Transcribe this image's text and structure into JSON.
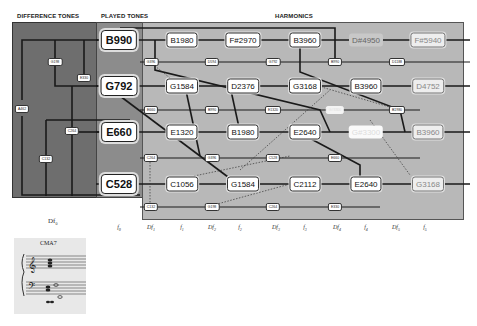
{
  "headers": {
    "difference_tones": "DIFFERENCE TONES",
    "played_tones": "PLAYED TONES",
    "harmonics": "HARMONICS"
  },
  "played_tones": [
    {
      "id": "B990",
      "label": "B990"
    },
    {
      "id": "G792",
      "label": "G792"
    },
    {
      "id": "E660",
      "label": "E660"
    },
    {
      "id": "C528",
      "label": "C528"
    }
  ],
  "harmonics": {
    "row_B": [
      "B1980",
      "F#2970",
      "B3960",
      "D#4950",
      "F#5940"
    ],
    "row_G": [
      "G1584",
      "D2376",
      "G3168",
      "B3960",
      "D4752"
    ],
    "row_E": [
      "E1320",
      "B1980",
      "E2640",
      "G#3300",
      "B3960"
    ],
    "row_C": [
      "C1056",
      "G1584",
      "C2112",
      "E2640",
      "G3168"
    ]
  },
  "difference_tone_tags": {
    "left": [
      "G198",
      "E330",
      "A462",
      "C264",
      "C132"
    ],
    "row1": [
      "G396",
      "D594",
      "G792",
      "B990",
      "D1188"
    ],
    "row2": [
      "E660",
      "B990",
      "E1320",
      "G#3300",
      "B1980"
    ],
    "row3": [
      "C264",
      "G396",
      "C528",
      "E660"
    ],
    "row4": [
      "C132",
      "G198",
      "C264",
      "E330"
    ]
  },
  "axis_labels": [
    {
      "base": "f",
      "sub": "0"
    },
    {
      "base": "Df",
      "sub": "1"
    },
    {
      "base": "f",
      "sub": "1"
    },
    {
      "base": "Df",
      "sub": "2"
    },
    {
      "base": "f",
      "sub": "2"
    },
    {
      "base": "Df",
      "sub": "3"
    },
    {
      "base": "f",
      "sub": "3"
    },
    {
      "base": "Df",
      "sub": "4"
    },
    {
      "base": "f",
      "sub": "4"
    },
    {
      "base": "Df",
      "sub": "5"
    },
    {
      "base": "f",
      "sub": "5"
    }
  ],
  "score": {
    "label": "Df",
    "label_sub": "0",
    "chord_name": "CMA7"
  }
}
